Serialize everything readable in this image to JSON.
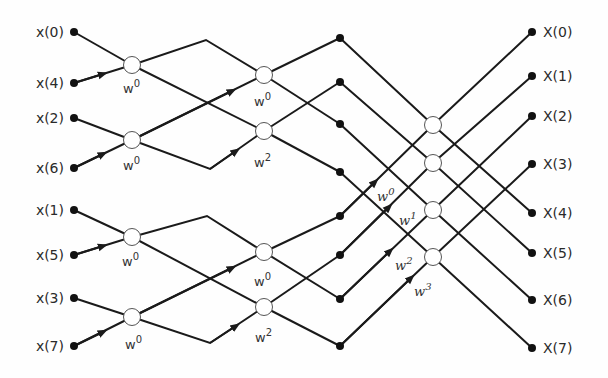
{
  "diagram": {
    "inputs": [
      "x(0)",
      "x(4)",
      "x(2)",
      "x(6)",
      "x(1)",
      "x(5)",
      "x(3)",
      "x(7)"
    ],
    "outputs": [
      "X(0)",
      "X(1)",
      "X(2)",
      "X(3)",
      "X(4)",
      "X(5)",
      "X(6)",
      "X(7)"
    ],
    "stage1": {
      "twiddles": [
        {
          "base": "W",
          "exp": "0"
        },
        {
          "base": "W",
          "exp": "0"
        },
        {
          "base": "W",
          "exp": "0"
        },
        {
          "base": "W",
          "exp": "0"
        }
      ]
    },
    "stage2": {
      "twiddles": [
        {
          "base": "W",
          "exp": "0"
        },
        {
          "base": "W",
          "exp": "2"
        },
        {
          "base": "W",
          "exp": "0"
        },
        {
          "base": "W",
          "exp": "2"
        }
      ]
    },
    "stage3": {
      "twiddles": [
        {
          "base": "W",
          "exp": "0"
        },
        {
          "base": "W",
          "exp": "1"
        },
        {
          "base": "W",
          "exp": "2"
        },
        {
          "base": "W",
          "exp": "3"
        }
      ]
    },
    "colors": {
      "line": "#1a1a1a",
      "node_fill": "#ffffff",
      "node_stroke": "#555555",
      "text": "#2a2a2a"
    }
  }
}
